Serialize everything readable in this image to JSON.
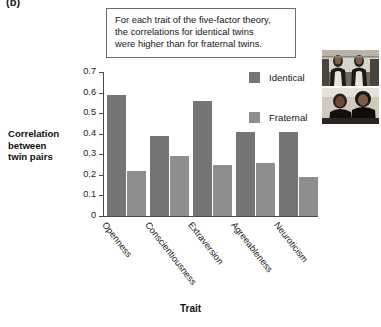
{
  "figure": {
    "panel_label": "(b)",
    "caption_lines": [
      "For each trait of the five-factor theory,",
      "the correlations for identical twins",
      "were higher than for fraternal twins."
    ]
  },
  "photos": [
    {
      "name": "identical-twins-photo",
      "alt": "Identical twins photograph"
    },
    {
      "name": "fraternal-twins-photo",
      "alt": "Fraternal twins photograph"
    }
  ],
  "colors": {
    "identical": "#757575",
    "fraternal": "#8e8e8e",
    "axis": "#4a4a4a",
    "text": "#141414",
    "caption_border": "#6d6d6d"
  },
  "chart_data": {
    "type": "bar",
    "title": "",
    "xlabel": "Trait",
    "ylabel": "Correlation between twin pairs",
    "ylabel_lines": [
      "Correlation",
      "between",
      "twin pairs"
    ],
    "categories": [
      "Openness",
      "Conscientiousness",
      "Extraversion",
      "Agreeableness",
      "Neuroticism"
    ],
    "series": [
      {
        "name": "Identical",
        "values": [
          0.59,
          0.39,
          0.56,
          0.41,
          0.41
        ]
      },
      {
        "name": "Fraternal",
        "values": [
          0.22,
          0.29,
          0.25,
          0.26,
          0.19
        ]
      }
    ],
    "ylim": [
      0,
      0.7
    ],
    "yticks": [
      0.7,
      0.6,
      0.5,
      0.4,
      0.3,
      0.2,
      0.1,
      0
    ],
    "ytick_labels": [
      "0.7",
      "0.6",
      "0.5",
      "0.4",
      "0.3",
      "0.2",
      "0.1",
      "0"
    ],
    "grid": false,
    "legend_position": "upper-right"
  }
}
